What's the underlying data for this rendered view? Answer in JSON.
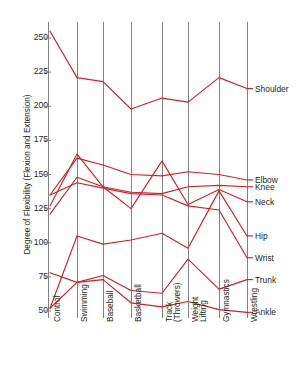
{
  "chart_data": {
    "type": "line",
    "subtype": "parallel-coordinates",
    "title": "",
    "xlabel": "",
    "ylabel": "Degree of Flexibility (Flexion and Extension)",
    "ylim": [
      45,
      262
    ],
    "yticks": [
      50,
      75,
      100,
      125,
      150,
      175,
      200,
      225,
      250
    ],
    "grid": "vertical-category-axes",
    "legend": "right-inline-labels",
    "line_color": "#cc2229",
    "axis_color": "#808285",
    "categories": [
      "Control",
      "Swimming",
      "Baseball",
      "Basketball",
      "Track (Throwers)",
      "Weight Lifting",
      "Gymnastics",
      "Wrestling"
    ],
    "category_labels": [
      {
        "line1": "Control",
        "line2": ""
      },
      {
        "line1": "Swimming",
        "line2": ""
      },
      {
        "line1": "Baseball",
        "line2": ""
      },
      {
        "line1": "Basketball",
        "line2": ""
      },
      {
        "line1": "Track",
        "line2": "(Throwers)"
      },
      {
        "line1": "Weight",
        "line2": "Lifting"
      },
      {
        "line1": "Gymnastics",
        "line2": ""
      },
      {
        "line1": "Wrestling",
        "line2": ""
      }
    ],
    "series": [
      {
        "name": "Shoulder",
        "values": [
          255,
          221,
          218,
          198,
          206,
          203,
          221,
          213
        ]
      },
      {
        "name": "Elbow",
        "values": [
          135,
          162,
          157,
          150,
          149,
          152,
          150,
          146
        ]
      },
      {
        "name": "Knee",
        "values": [
          121,
          148,
          141,
          137,
          136,
          141,
          142,
          141
        ]
      },
      {
        "name": "Neck",
        "values": [
          127,
          165,
          141,
          125,
          160,
          128,
          139,
          130
        ]
      },
      {
        "name": "Hip",
        "values": [
          52,
          105,
          99,
          102,
          107,
          96,
          138,
          105
        ]
      },
      {
        "name": "Wrist",
        "values": [
          135,
          144,
          140,
          136,
          135,
          127,
          124,
          89
        ]
      },
      {
        "name": "Trunk",
        "values": [
          78,
          71,
          76,
          65,
          63,
          88,
          66,
          73
        ]
      },
      {
        "name": "Ankle",
        "values": [
          52,
          71,
          73,
          56,
          53,
          57,
          51,
          49
        ]
      }
    ]
  }
}
